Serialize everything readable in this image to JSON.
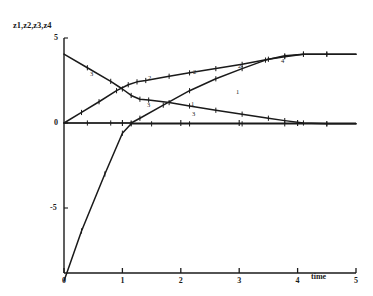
{
  "chart_data": {
    "type": "line",
    "title": "",
    "subtitle": "",
    "xlabel": "time",
    "ylabel": "z1,z2,z3,z4",
    "xlim": [
      0,
      5
    ],
    "ylim": [
      -9.3,
      5
    ],
    "grid": false,
    "legend_position": "inline-curve-labels",
    "x_ticks": [
      "0",
      "1",
      "2",
      "3",
      "4",
      "5"
    ],
    "x_tick_values": [
      0,
      1,
      2,
      3,
      4,
      5
    ],
    "y_ticks": [
      "5",
      "0",
      "-5"
    ],
    "y_tick_values": [
      5,
      0,
      -5
    ],
    "series": [
      {
        "name": "1",
        "label": "1",
        "color": "#1a1a1a",
        "x": [
          0.0,
          0.4,
          0.8,
          1.15,
          1.3,
          1.7,
          2.15,
          2.6,
          3.05,
          3.45,
          3.78,
          4.1,
          4.5,
          5.0
        ],
        "values": [
          0.0,
          0.0,
          0.0,
          0.0,
          0.28,
          1.05,
          1.9,
          2.6,
          3.2,
          3.7,
          3.95,
          4.05,
          4.05,
          4.05
        ]
      },
      {
        "name": "2",
        "label": "2",
        "color": "#1a1a1a",
        "x": [
          0.0,
          0.3,
          0.6,
          0.9,
          1.1,
          1.25,
          1.4,
          1.8,
          2.15,
          2.6,
          3.05,
          3.5,
          3.78,
          4.1,
          4.5,
          5.0
        ],
        "values": [
          0.0,
          0.62,
          1.25,
          1.9,
          2.25,
          2.42,
          2.5,
          2.75,
          2.95,
          3.2,
          3.45,
          3.75,
          3.9,
          4.05,
          4.05,
          4.05
        ]
      },
      {
        "name": "3",
        "label": "3",
        "color": "#1a1a1a",
        "x": [
          0.0,
          0.4,
          0.8,
          1.0,
          1.15,
          1.3,
          1.45,
          1.8,
          2.15,
          2.6,
          3.05,
          3.5,
          3.78,
          4.1,
          4.5,
          5.0
        ],
        "values": [
          4.05,
          3.25,
          2.45,
          2.0,
          1.62,
          1.4,
          1.35,
          1.2,
          1.0,
          0.75,
          0.52,
          0.28,
          0.14,
          0.0,
          -0.05,
          -0.05
        ]
      },
      {
        "name": "4",
        "label": "4",
        "color": "#1a1a1a",
        "x": [
          0.0,
          0.3,
          0.7,
          1.0,
          1.15,
          1.5,
          2.15,
          3.05,
          3.78,
          4.5,
          5.0
        ],
        "values": [
          -9.3,
          -6.35,
          -3.0,
          -0.6,
          -0.05,
          -0.05,
          -0.05,
          -0.05,
          -0.05,
          -0.05,
          -0.05
        ]
      }
    ],
    "curve_labels": [
      {
        "text": "3",
        "x_px": 90,
        "y_px": 70
      },
      {
        "text": "2",
        "x_px": 148,
        "y_px": 74
      },
      {
        "text": "2",
        "x_px": 193,
        "y_px": 68
      },
      {
        "text": "2",
        "x_px": 238,
        "y_px": 62
      },
      {
        "text": "3",
        "x_px": 147,
        "y_px": 101
      },
      {
        "text": "3",
        "x_px": 192,
        "y_px": 110
      },
      {
        "text": "1",
        "x_px": 191,
        "y_px": 100
      },
      {
        "text": "1",
        "x_px": 236,
        "y_px": 88
      },
      {
        "text": "4",
        "x_px": 281,
        "y_px": 57
      }
    ]
  },
  "axes": {
    "y_axis_title": "z1,z2,z3,z4",
    "x_axis_title": "time"
  }
}
